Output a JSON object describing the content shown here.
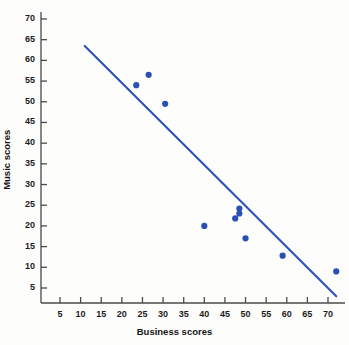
{
  "chart_data": {
    "type": "scatter",
    "title": "",
    "xlabel": "Business scores",
    "ylabel": "Music scores",
    "xlim": [
      0,
      73.5
    ],
    "ylim": [
      0,
      73
    ],
    "xticks": [
      5,
      10,
      15,
      20,
      25,
      30,
      35,
      40,
      45,
      50,
      55,
      60,
      65,
      70
    ],
    "yticks": [
      5,
      10,
      15,
      20,
      25,
      30,
      35,
      40,
      45,
      50,
      55,
      60,
      65,
      70
    ],
    "grid": false,
    "legend": "none",
    "marker_color": "#2b50b4",
    "line_color": "#2c52b8",
    "axis_color": "#4a4a4a",
    "points": [
      {
        "x": 23.5,
        "y": 54.0
      },
      {
        "x": 26.5,
        "y": 56.5
      },
      {
        "x": 30.5,
        "y": 49.5
      },
      {
        "x": 40.0,
        "y": 20.0
      },
      {
        "x": 47.5,
        "y": 21.8
      },
      {
        "x": 48.5,
        "y": 23.0
      },
      {
        "x": 48.5,
        "y": 24.2
      },
      {
        "x": 50.0,
        "y": 17.0
      },
      {
        "x": 59.0,
        "y": 12.8
      },
      {
        "x": 72.0,
        "y": 9.0
      }
    ],
    "trend_line": {
      "x1": 11.0,
      "y1": 63.5,
      "x2": 72.0,
      "y2": 3.0
    }
  },
  "axes": {
    "x_tick_labels": [
      "5",
      "10",
      "15",
      "20",
      "25",
      "30",
      "35",
      "40",
      "45",
      "50",
      "55",
      "60",
      "65",
      "70"
    ],
    "y_tick_labels": [
      "5",
      "10",
      "15",
      "20",
      "25",
      "30",
      "35",
      "40",
      "45",
      "50",
      "55",
      "60",
      "65",
      "70"
    ],
    "x_axis_title": "Business scores",
    "y_axis_title": "Music scores"
  }
}
